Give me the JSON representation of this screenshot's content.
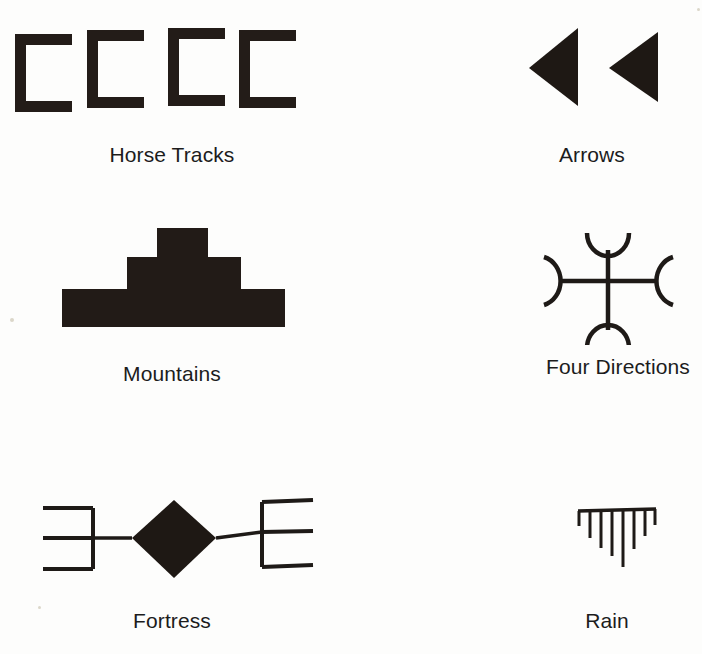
{
  "page": {
    "background_color": "#fdfdfc",
    "ink_color": "#1e1814",
    "caption_color": "#1c1c1c",
    "kind": "scanned-figure-plate"
  },
  "symbols": [
    {
      "id": "horse-tracks",
      "label": "Horse Tracks",
      "icon_name": "horse-tracks-symbol",
      "shape": "four open brackets (C shapes) in a row",
      "count": 4,
      "caption_center_x": 172,
      "caption_y": 143
    },
    {
      "id": "arrows",
      "label": "Arrows",
      "icon_name": "arrows-symbol",
      "shape": "two solid left-pointing triangles",
      "count": 2,
      "caption_center_x": 592,
      "caption_y": 143
    },
    {
      "id": "mountains",
      "label": "Mountains",
      "icon_name": "mountains-symbol",
      "shape": "solid three-tier stepped pyramid",
      "tiers": 3,
      "caption_center_x": 172,
      "caption_y": 362
    },
    {
      "id": "four-directions",
      "label": "Four Directions",
      "icon_name": "four-directions-symbol",
      "shape": "cross with crescent arcs opening outward at each of four arm ends",
      "arms": 4,
      "caption_center_x": 618,
      "caption_y": 355
    },
    {
      "id": "fortress",
      "label": "Fortress",
      "icon_name": "fortress-symbol",
      "shape": "solid diamond with horizontal lines to three-pronged E and reversed-E ends",
      "prongs_per_side": 3,
      "caption_center_x": 172,
      "caption_y": 609
    },
    {
      "id": "rain",
      "label": "Rain",
      "icon_name": "rain-symbol",
      "shape": "horizontal bar with eight vertical strokes hanging below, longest at center",
      "strokes": 8,
      "caption_center_x": 607,
      "caption_y": 609
    }
  ]
}
